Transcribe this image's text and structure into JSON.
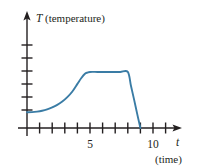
{
  "figure": {
    "kind": "line-graph",
    "background_color": "#ffffff",
    "axis_color": "#231f20",
    "curve_color": "#3a7ca5",
    "y_axis": {
      "variable": "T",
      "label": "(temperature)",
      "tick_count": 6,
      "ticks_labeled": false
    },
    "x_axis": {
      "variable": "t",
      "label": "(time)",
      "tick_labels": [
        "5",
        "10"
      ],
      "tick_count": 11
    }
  },
  "chart_data": {
    "type": "line",
    "title": "",
    "xlabel": "t (time)",
    "ylabel": "T (temperature)",
    "xlim": [
      0,
      12
    ],
    "ylim": [
      0,
      7.5
    ],
    "grid": false,
    "legend": null,
    "xticks": [
      1,
      2,
      3,
      4,
      5,
      6,
      7,
      8,
      9,
      10,
      11
    ],
    "xticklabels": [
      "",
      "",
      "",
      "",
      "5",
      "",
      "",
      "",
      "",
      "10",
      ""
    ],
    "yticks": [
      1,
      2,
      3,
      4,
      5,
      6
    ],
    "yticklabels": [
      "",
      "",
      "",
      "",
      "",
      ""
    ],
    "series": [
      {
        "name": "T(t)",
        "color": "#3a7ca5",
        "description": "Temperature starts low and nearly constant, rises with increasing steepness to a maximum at t=5, holds constant until t=8, then falls steeply to zero at t=9.",
        "x": [
          0.0,
          0.4,
          0.8,
          1.2,
          1.6,
          2.0,
          2.4,
          2.8,
          3.2,
          3.6,
          4.0,
          4.3,
          4.6,
          4.8,
          5.0,
          5.6,
          6.2,
          6.8,
          7.4,
          8.0,
          8.25,
          8.5,
          8.75,
          9.0
        ],
        "y": [
          1.25,
          1.26,
          1.3,
          1.37,
          1.48,
          1.63,
          1.83,
          2.1,
          2.45,
          2.9,
          3.5,
          3.95,
          4.3,
          4.4,
          4.45,
          4.45,
          4.45,
          4.45,
          4.45,
          4.45,
          3.35,
          2.25,
          1.1,
          0.0
        ]
      }
    ],
    "annotations": [
      {
        "text": "T (temperature)",
        "role": "y-axis-title"
      },
      {
        "text": "t",
        "role": "x-axis-variable"
      },
      {
        "text": "(time)",
        "role": "x-axis-unit"
      }
    ]
  }
}
